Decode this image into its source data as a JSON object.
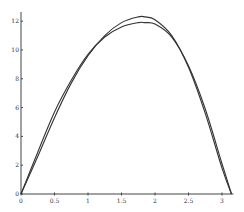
{
  "chart_data": {
    "type": "line",
    "title": "",
    "xlabel": "",
    "ylabel": "",
    "xlim": [
      0,
      3.1416
    ],
    "ylim": [
      0,
      12.5
    ],
    "grid": false,
    "legend": null,
    "x_ticks": [
      "0",
      "0.5",
      "1",
      "1.5",
      "2",
      "2.5",
      "3"
    ],
    "y_ticks": [
      "0",
      "2",
      "4",
      "6",
      "8",
      "10",
      "12"
    ],
    "x": [
      0,
      0.25,
      0.5,
      0.75,
      1.0,
      1.25,
      1.5,
      1.75,
      1.85,
      2.0,
      2.25,
      2.5,
      2.75,
      3.0,
      3.1416
    ],
    "series": [
      {
        "name": "curve-1",
        "color": "#333333",
        "values": [
          0,
          2.6,
          5.3,
          7.7,
          9.6,
          11.0,
          11.9,
          12.3,
          12.3,
          12.1,
          11.0,
          8.8,
          5.6,
          1.8,
          0
        ]
      },
      {
        "name": "curve-2",
        "color": "#333333",
        "values": [
          0,
          2.9,
          5.7,
          7.9,
          9.7,
          10.9,
          11.6,
          11.9,
          11.9,
          11.8,
          10.9,
          8.9,
          5.9,
          2.1,
          0
        ]
      }
    ]
  }
}
